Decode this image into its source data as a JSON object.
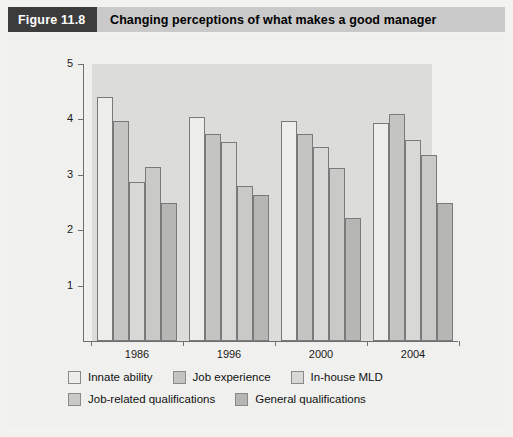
{
  "header": {
    "figure_tag": "Figure 11.8",
    "title": "Changing perceptions of what makes a good manager"
  },
  "chart_data": {
    "type": "bar",
    "title": "Changing perceptions of what makes a good manager",
    "xlabel": "",
    "ylabel": "",
    "ylim": [
      0,
      5
    ],
    "yticks": [
      1,
      2,
      3,
      4,
      5
    ],
    "grid": false,
    "legend_position": "bottom",
    "categories": [
      "1986",
      "1996",
      "2000",
      "2004"
    ],
    "series": [
      {
        "name": "Innate ability",
        "color": "#ededea",
        "values": [
          4.4,
          4.05,
          3.98,
          3.93
        ]
      },
      {
        "name": "Job experience",
        "color": "#c4c4c2",
        "values": [
          3.97,
          3.73,
          3.74,
          4.09
        ]
      },
      {
        "name": "In-house MLD",
        "color": "#d8d8d6",
        "values": [
          2.87,
          3.6,
          3.5,
          3.63
        ]
      },
      {
        "name": "Job-related qualifications",
        "color": "#c9c9c7",
        "values": [
          3.15,
          2.8,
          3.12,
          3.35
        ]
      },
      {
        "name": "General qualifications",
        "color": "#b6b6b4",
        "values": [
          2.49,
          2.64,
          2.22,
          2.5
        ]
      }
    ]
  },
  "legend": {
    "rows": [
      [
        {
          "label": "Innate ability",
          "color": "#ededea"
        },
        {
          "label": "Job experience",
          "color": "#c4c4c2"
        },
        {
          "label": "In-house MLD",
          "color": "#d8d8d6"
        }
      ],
      [
        {
          "label": "Job-related qualifications",
          "color": "#c9c9c7"
        },
        {
          "label": "General qualifications",
          "color": "#b6b6b4"
        }
      ]
    ]
  }
}
